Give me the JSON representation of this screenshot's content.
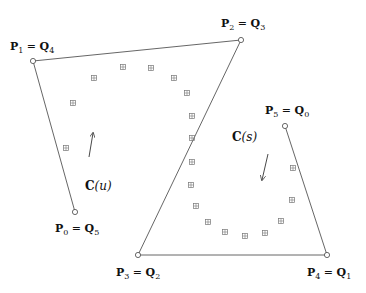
{
  "diagram": {
    "colors": {
      "line": "#555555",
      "point": "#444444",
      "marker": "#777777",
      "text": "#111111"
    },
    "points": [
      {
        "id": "P0",
        "label": "P",
        "sub": "0",
        "eq": " = ",
        "qlabel": "Q",
        "qsub": "5",
        "x": 75,
        "y": 212,
        "lx": 55,
        "ly": 232
      },
      {
        "id": "P1",
        "label": "P",
        "sub": "1",
        "eq": " = ",
        "qlabel": "Q",
        "qsub": "4",
        "x": 33,
        "y": 61,
        "lx": 10,
        "ly": 50
      },
      {
        "id": "P2",
        "label": "P",
        "sub": "2",
        "eq": " = ",
        "qlabel": "Q",
        "qsub": "3",
        "x": 241,
        "y": 40,
        "lx": 221,
        "ly": 27
      },
      {
        "id": "P3",
        "label": "P",
        "sub": "3",
        "eq": " = ",
        "qlabel": "Q",
        "qsub": "2",
        "x": 138,
        "y": 255,
        "lx": 116,
        "ly": 276
      },
      {
        "id": "P4",
        "label": "P",
        "sub": "4",
        "eq": " = ",
        "qlabel": "Q",
        "qsub": "1",
        "x": 327,
        "y": 255,
        "lx": 307,
        "ly": 276
      },
      {
        "id": "P5",
        "label": "P",
        "sub": "5",
        "eq": " = ",
        "qlabel": "Q",
        "qsub": "0",
        "x": 285,
        "y": 126,
        "lx": 265,
        "ly": 114
      }
    ],
    "curve_markers": [
      [
        66,
        148
      ],
      [
        73,
        103
      ],
      [
        94,
        78
      ],
      [
        123,
        67
      ],
      [
        151,
        68
      ],
      [
        174,
        78
      ],
      [
        187,
        93
      ],
      [
        192,
        116
      ],
      [
        192,
        138
      ],
      [
        192,
        162
      ],
      [
        191,
        185
      ],
      [
        196,
        206
      ],
      [
        208,
        222
      ],
      [
        225,
        232
      ],
      [
        245,
        236
      ],
      [
        265,
        233
      ],
      [
        281,
        221
      ],
      [
        292,
        200
      ],
      [
        293,
        168
      ]
    ],
    "curve_labels": {
      "cu": {
        "text": "C",
        "arg": "(u)",
        "x": 85,
        "y": 190
      },
      "cs": {
        "text": "C",
        "arg": "(s)",
        "x": 232,
        "y": 141
      }
    },
    "arrows": [
      {
        "name": "direction-u",
        "x1": 89,
        "y1": 157,
        "x2": 93,
        "y2": 133
      },
      {
        "name": "direction-s",
        "x1": 268,
        "y1": 154,
        "x2": 262,
        "y2": 180
      }
    ]
  }
}
